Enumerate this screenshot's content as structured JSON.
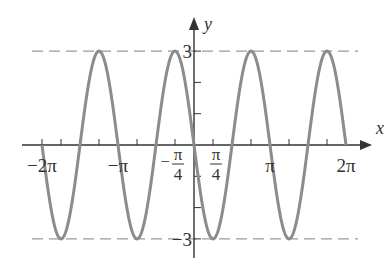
{
  "chart_data": {
    "type": "line",
    "title": "",
    "function": "y = -3 sin(2x)",
    "amplitude": 3,
    "angular_frequency": 2,
    "sign": -1,
    "xlabel": "x",
    "ylabel": "y",
    "xlim": [
      -2.25,
      2.25
    ],
    "xlim_units": "pi",
    "ylim": [
      -3.5,
      3.8
    ],
    "domain_pi": [
      -2,
      2
    ],
    "x_minor_tick_step_pi": 0.25,
    "y_ticks": [
      -3,
      -2,
      -1,
      1,
      2,
      3
    ],
    "x_tick_labels": [
      {
        "value_pi": -2,
        "text": "−2π",
        "type": "plain"
      },
      {
        "value_pi": -1,
        "text": "−π",
        "type": "plain"
      },
      {
        "value_pi": -0.25,
        "sign": "−",
        "num": "π",
        "den": "4",
        "type": "fraction"
      },
      {
        "value_pi": 0.25,
        "sign": "",
        "num": "π",
        "den": "4",
        "type": "fraction"
      },
      {
        "value_pi": 1,
        "text": "π",
        "type": "plain"
      },
      {
        "value_pi": 2,
        "text": "2π",
        "type": "plain"
      }
    ],
    "y_tick_labels": [
      {
        "value": 3,
        "text": "3"
      },
      {
        "value": -3,
        "text": "−3"
      }
    ],
    "reference_lines": [
      {
        "y": 3,
        "style": "dashed"
      },
      {
        "y": -3,
        "style": "dashed"
      }
    ],
    "key_points": [
      {
        "x_pi": -1.75,
        "y": -3
      },
      {
        "x_pi": -1.25,
        "y": 3
      },
      {
        "x_pi": -0.75,
        "y": -3
      },
      {
        "x_pi": -0.25,
        "y": 3
      },
      {
        "x_pi": 0.25,
        "y": -3
      },
      {
        "x_pi": 0.75,
        "y": 3
      },
      {
        "x_pi": 1.25,
        "y": -3
      },
      {
        "x_pi": 1.75,
        "y": 3
      }
    ],
    "colors": {
      "curve": "#8c8c8c",
      "axis": "#333333",
      "dash": "#9a9a9a",
      "text": "#333333"
    },
    "grid": false,
    "legend": "none"
  }
}
